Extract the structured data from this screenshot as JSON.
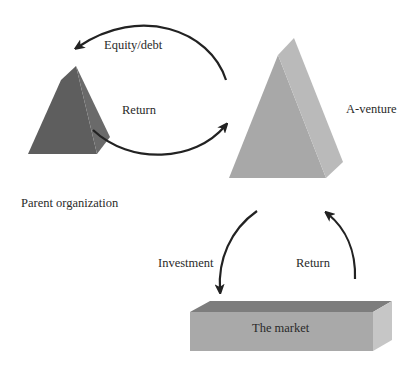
{
  "diagram": {
    "nodes": {
      "parent": {
        "label": "Parent organization",
        "shape": "pyramid",
        "color_front": "#5f5f5f",
        "color_side": "#6a6a6a"
      },
      "venture": {
        "label": "A-venture",
        "shape": "pyramid",
        "color_front": "#a9a9a9",
        "color_side": "#bcbcbc"
      },
      "market": {
        "label": "The market",
        "shape": "box",
        "color_front": "#a8a8a8",
        "color_top": "#7e7e7e",
        "color_side": "#c4c4c4"
      }
    },
    "edges": [
      {
        "from": "venture",
        "to": "parent",
        "label": "Equity/debt"
      },
      {
        "from": "parent",
        "to": "venture",
        "label": "Return"
      },
      {
        "from": "venture",
        "to": "market",
        "label": "Investment"
      },
      {
        "from": "market",
        "to": "venture",
        "label": "Return"
      }
    ],
    "arrow_color": "#222222"
  }
}
